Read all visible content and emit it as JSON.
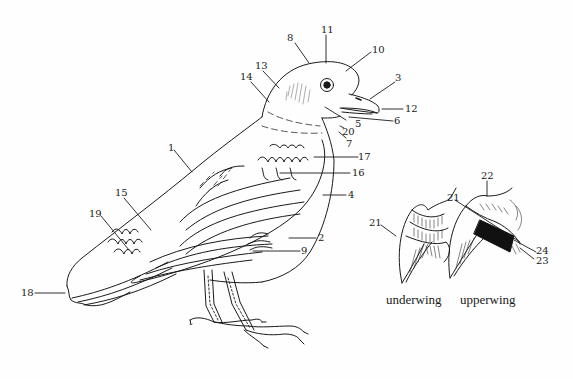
{
  "diagram": {
    "stroke_color": "#1a1a1a",
    "background": "#fefefe"
  },
  "labels": {
    "n1": "1",
    "n2": "2",
    "n3": "3",
    "n4": "4",
    "n5": "5",
    "n6": "6",
    "n7": "7",
    "n8": "8",
    "n9": "9",
    "n10": "10",
    "n11": "11",
    "n12": "12",
    "n13": "13",
    "n14": "14",
    "n15": "15",
    "n16": "16",
    "n17": "17",
    "n18": "18",
    "n19": "19",
    "n20": "20",
    "n21a": "21",
    "n21b": "21",
    "n22": "22",
    "n23": "23",
    "n24": "24"
  },
  "captions": {
    "underwing": "underwing",
    "upperwing": "upperwing"
  }
}
